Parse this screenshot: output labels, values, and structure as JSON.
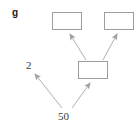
{
  "figure": {
    "panel_letter": "g",
    "background_color": "#ffffff",
    "box_stroke_color": "#9e9e9e",
    "arrow_color": "#a8a8a8",
    "text_color": "#3a3a3a"
  },
  "nodes": [
    {
      "id": "top-left",
      "label": "",
      "x": 52,
      "y": 12,
      "width": 30,
      "height": 18
    },
    {
      "id": "top-right",
      "label": "",
      "x": 104,
      "y": 12,
      "width": 30,
      "height": 18
    },
    {
      "id": "middle",
      "label": "",
      "x": 78,
      "y": 61,
      "width": 30,
      "height": 18
    }
  ],
  "labels": {
    "two": "2",
    "fifty": "50"
  },
  "edges": [
    {
      "id": "middle-to-top-left",
      "from": "middle",
      "to": "top-left",
      "arrowhead": "to"
    },
    {
      "id": "middle-to-top-right",
      "from": "middle",
      "to": "top-right",
      "arrowhead": "to"
    },
    {
      "id": "fifty-to-two",
      "from": "fifty",
      "to": "two",
      "arrowhead": "to"
    },
    {
      "id": "fifty-to-middle",
      "from": "fifty",
      "to": "middle",
      "arrowhead": "to"
    }
  ]
}
